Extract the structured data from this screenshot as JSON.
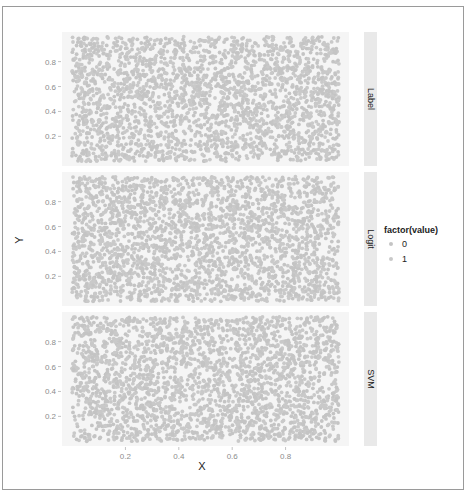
{
  "chart_data": {
    "type": "scatter",
    "title": "",
    "xlabel": "X",
    "ylabel": "Y",
    "xlim": [
      0,
      1
    ],
    "ylim": [
      0,
      1
    ],
    "x_ticks": [
      0.2,
      0.4,
      0.6,
      0.8
    ],
    "x_tick_labels": [
      "0.2",
      "0.4",
      "0.6",
      "0.8"
    ],
    "y_ticks": [
      0.2,
      0.4,
      0.6,
      0.8
    ],
    "y_tick_labels": [
      "0.2",
      "0.4",
      "0.6",
      "0.8"
    ],
    "grid": false,
    "facets": [
      {
        "label": "Label",
        "n_points": 2500,
        "seed": 11
      },
      {
        "label": "Logit",
        "n_points": 2500,
        "seed": 23
      },
      {
        "label": "SVM",
        "n_points": 2500,
        "seed": 37
      }
    ],
    "legend": {
      "title": "factor(value)",
      "position": "right",
      "entries": [
        {
          "label": "0",
          "color": "#c4c4c4"
        },
        {
          "label": "1",
          "color": "#c9c9c9"
        }
      ]
    },
    "distribution": "uniform random points over [0,1]x[0,1] in each facet"
  },
  "colors": {
    "panel_bg": "#f5f5f5",
    "strip_bg": "#e9e9e9",
    "point": "#c4c4c4",
    "frame": "#9a9a9a"
  }
}
